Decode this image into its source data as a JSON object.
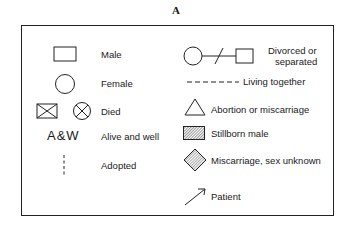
{
  "title": "A",
  "legend": {
    "male": "Male",
    "female": "Female",
    "died": "Died",
    "aw_symbol": "A&W",
    "alive_and_well": "Alive and well",
    "adopted": "Adopted",
    "divorced_line1": "Divorced or",
    "divorced_line2": "separated",
    "living_together": "Living together",
    "abortion": "Abortion or miscarriage",
    "stillborn_male": "Stillborn male",
    "miscarriage_unknown": "Miscarriage, sex unknown",
    "patient": "Patient"
  }
}
